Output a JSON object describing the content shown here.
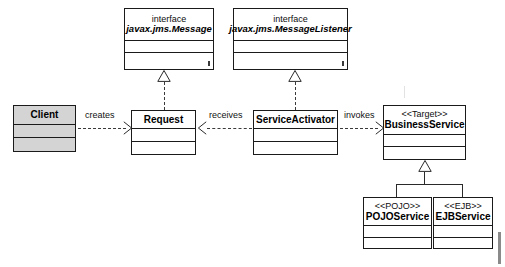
{
  "diagram": {
    "background_color": "#ffffff",
    "line_color": "#2a2a2a",
    "shaded_fill": "#d4d4d4"
  },
  "classes": [
    {
      "id": "message-interface",
      "keyword": "interface",
      "name": "javax.jms.Message",
      "stereotype": "",
      "shaded": false,
      "italic_name": true,
      "compartments": 2
    },
    {
      "id": "messagelistener-interface",
      "keyword": "interface",
      "name": "javax.jms.MessageListener",
      "stereotype": "",
      "shaded": false,
      "italic_name": true,
      "compartments": 2
    },
    {
      "id": "client",
      "keyword": "",
      "name": "Client",
      "stereotype": "",
      "shaded": true,
      "italic_name": false,
      "compartments": 2
    },
    {
      "id": "request",
      "keyword": "",
      "name": "Request",
      "stereotype": "",
      "shaded": false,
      "italic_name": false,
      "compartments": 2
    },
    {
      "id": "service-activator",
      "keyword": "",
      "name": "ServiceActivator",
      "stereotype": "",
      "shaded": false,
      "italic_name": false,
      "compartments": 2
    },
    {
      "id": "business-service",
      "keyword": "",
      "name": "BusinessService",
      "stereotype": "<<Target>>",
      "shaded": false,
      "italic_name": false,
      "compartments": 2
    },
    {
      "id": "pojo-service",
      "keyword": "",
      "name": "POJOService",
      "stereotype": "<<POJO>>",
      "shaded": false,
      "italic_name": false,
      "compartments": 2
    },
    {
      "id": "ejb-service",
      "keyword": "",
      "name": "EJBService",
      "stereotype": "<<EJB>>",
      "shaded": false,
      "italic_name": false,
      "compartments": 2
    }
  ],
  "relationships": [
    {
      "id": "creates",
      "label": "creates",
      "from": "client",
      "to": "request",
      "type": "dependency",
      "style": "dashed",
      "direction": "right"
    },
    {
      "id": "receives",
      "label": "receives",
      "from": "service-activator",
      "to": "request",
      "type": "dependency",
      "style": "dashed",
      "direction": "left"
    },
    {
      "id": "invokes",
      "label": "invokes",
      "from": "service-activator",
      "to": "business-service",
      "type": "dependency",
      "style": "dashed",
      "direction": "right"
    },
    {
      "id": "request-implements-message",
      "label": "",
      "from": "request",
      "to": "message-interface",
      "type": "realization",
      "style": "dashed",
      "direction": "up"
    },
    {
      "id": "activator-implements-messagelistener",
      "label": "",
      "from": "service-activator",
      "to": "messagelistener-interface",
      "type": "realization",
      "style": "dashed",
      "direction": "up"
    },
    {
      "id": "pojo-extends-business",
      "label": "",
      "from": "pojo-service",
      "to": "business-service",
      "type": "generalization",
      "style": "solid",
      "direction": "up"
    },
    {
      "id": "ejb-extends-business",
      "label": "",
      "from": "ejb-service",
      "to": "business-service",
      "type": "generalization",
      "style": "solid",
      "direction": "up"
    }
  ]
}
